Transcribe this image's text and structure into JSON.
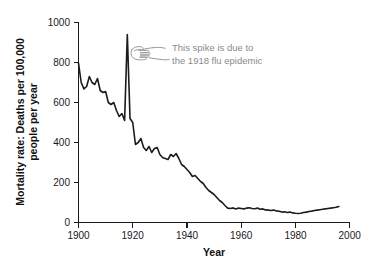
{
  "chart_data": {
    "type": "line",
    "title": "",
    "xlabel": "Year",
    "ylabel": "Mortality rate: Deaths per 100,000 people per year",
    "ylabel_line1": "Mortality rate: Deaths per 100,000",
    "ylabel_line2": "people per year",
    "xlim": [
      1900,
      2000
    ],
    "ylim": [
      0,
      1000
    ],
    "xticks": [
      1900,
      1920,
      1940,
      1960,
      1980,
      2000
    ],
    "xtick_labels": [
      "1900",
      "1920",
      "1940",
      "1960",
      "1980",
      "2000"
    ],
    "yticks": [
      0,
      200,
      400,
      600,
      800,
      1000
    ],
    "ytick_labels": [
      "0",
      "200",
      "400",
      "600",
      "800",
      "1000"
    ],
    "grid": false,
    "legend": "none",
    "line_color": "#1c1c1c",
    "series": [
      {
        "name": "Mortality rate",
        "x": [
          1900,
          1901,
          1902,
          1903,
          1904,
          1905,
          1906,
          1907,
          1908,
          1909,
          1910,
          1911,
          1912,
          1913,
          1914,
          1915,
          1916,
          1917,
          1918,
          1919,
          1920,
          1921,
          1922,
          1923,
          1924,
          1925,
          1926,
          1927,
          1928,
          1929,
          1930,
          1931,
          1932,
          1933,
          1934,
          1935,
          1936,
          1937,
          1938,
          1939,
          1940,
          1941,
          1942,
          1943,
          1944,
          1945,
          1946,
          1947,
          1948,
          1949,
          1950,
          1951,
          1952,
          1953,
          1954,
          1955,
          1956,
          1957,
          1958,
          1959,
          1960,
          1961,
          1962,
          1963,
          1964,
          1965,
          1966,
          1967,
          1968,
          1969,
          1970,
          1971,
          1972,
          1973,
          1974,
          1975,
          1976,
          1977,
          1978,
          1979,
          1980,
          1981,
          1982,
          1983,
          1984,
          1985,
          1986,
          1987,
          1988,
          1989,
          1990,
          1991,
          1992,
          1993,
          1994,
          1995,
          1996
        ],
        "values": [
          797,
          700,
          668,
          680,
          730,
          700,
          690,
          720,
          660,
          650,
          655,
          600,
          590,
          600,
          560,
          530,
          545,
          510,
          940,
          520,
          500,
          390,
          400,
          420,
          375,
          360,
          380,
          350,
          370,
          375,
          340,
          325,
          320,
          315,
          340,
          330,
          345,
          320,
          290,
          280,
          265,
          250,
          230,
          235,
          220,
          205,
          195,
          175,
          160,
          150,
          140,
          125,
          110,
          100,
          85,
          72,
          70,
          73,
          68,
          72,
          70,
          68,
          72,
          74,
          70,
          69,
          72,
          66,
          68,
          63,
          62,
          60,
          62,
          58,
          56,
          52,
          54,
          50,
          52,
          48,
          46,
          45,
          46,
          50,
          52,
          55,
          57,
          60,
          62,
          64,
          66,
          68,
          70,
          72,
          74,
          76,
          80
        ]
      }
    ],
    "annotation": {
      "line1": "This spike is due to",
      "line2": "the 1918 flu epidemic",
      "icon": "pointing-hand-icon",
      "color": "#8a8a8a",
      "points_to_year": 1918
    }
  }
}
